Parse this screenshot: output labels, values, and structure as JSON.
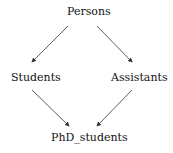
{
  "nodes": {
    "top": "Persons",
    "left": "Students",
    "right": "Assistants",
    "bottom": "PhD_students"
  },
  "edges": [
    {
      "from": "Persons",
      "to": "Students"
    },
    {
      "from": "Persons",
      "to": "Assistants"
    },
    {
      "from": "Students",
      "to": "PhD_students"
    },
    {
      "from": "Assistants",
      "to": "PhD_students"
    }
  ]
}
